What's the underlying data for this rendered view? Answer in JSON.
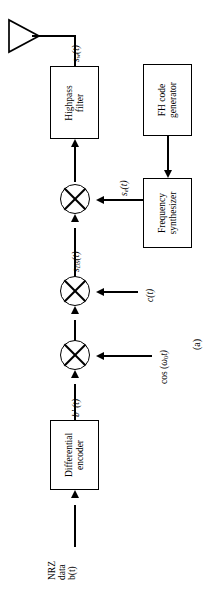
{
  "figure": {
    "caption": "(a)",
    "orientation": "rotated-90-ccw",
    "type": "block-diagram"
  },
  "blocks": [
    {
      "id": "highpass-filter",
      "line1": "Highpass",
      "line2": "filter"
    },
    {
      "id": "fh-code-generator",
      "line1": "FH code",
      "line2": "generator"
    },
    {
      "id": "frequency-synthesizer",
      "line1": "Frequency",
      "line2": "synthesizer"
    },
    {
      "id": "differential-encoder",
      "line1": "Differential",
      "line2": "encoder"
    }
  ],
  "signals": {
    "output": {
      "base": "s",
      "sub": "w",
      "arg": "(t)"
    },
    "fh_carrier": {
      "base": "s",
      "sub": "e",
      "arg": "(t)"
    },
    "ds_signal": {
      "base": "s",
      "sub": "DS",
      "arg": "(t)"
    },
    "encoded_data": {
      "base": "b'",
      "sub": "",
      "arg": "(t)"
    },
    "pn_code": {
      "base": "c",
      "sub": "",
      "arg": "(t)"
    },
    "carrier": {
      "text": "cos (ω0t)",
      "pre": "cos (",
      "omega": "ω",
      "sub": "0",
      "post": "t)"
    }
  },
  "input": {
    "line1": "NRZ",
    "line2": "data",
    "line3": "b(t)"
  },
  "icons": {
    "antenna": "antenna-icon",
    "mixer": "mixer-icon",
    "arrow": "arrow-icon"
  },
  "colors": {
    "stroke": "#000000",
    "background": "#ffffff"
  }
}
